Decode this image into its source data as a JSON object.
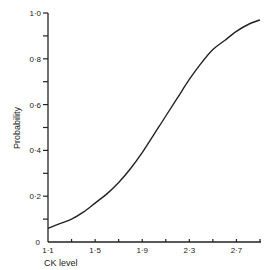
{
  "chart_data": {
    "type": "line",
    "title": "",
    "xlabel": "CK level",
    "ylabel": "Probability",
    "xlim": [
      1.1,
      2.9
    ],
    "ylim": [
      0,
      1.0
    ],
    "grid": false,
    "legend": null,
    "x_ticks": [
      1.1,
      1.3,
      1.5,
      1.7,
      1.9,
      2.1,
      2.3,
      2.5,
      2.7,
      2.9
    ],
    "x_tick_labels": [
      "1·1",
      "",
      "1·5",
      "",
      "1·9",
      "",
      "2·3",
      "",
      "2·7",
      ""
    ],
    "y_ticks": [
      0,
      0.1,
      0.2,
      0.3,
      0.4,
      0.5,
      0.6,
      0.7,
      0.8,
      0.9,
      1.0
    ],
    "y_tick_labels": [
      "0",
      "",
      "0·2",
      "",
      "0·4",
      "",
      "0·6",
      "",
      "0·8",
      "",
      "1·0"
    ],
    "series": [
      {
        "name": "Probability",
        "x": [
          1.1,
          1.2,
          1.3,
          1.4,
          1.5,
          1.6,
          1.7,
          1.8,
          1.9,
          2.0,
          2.1,
          2.2,
          2.3,
          2.4,
          2.5,
          2.6,
          2.7,
          2.8,
          2.9
        ],
        "y": [
          0.06,
          0.08,
          0.1,
          0.13,
          0.17,
          0.21,
          0.26,
          0.32,
          0.39,
          0.47,
          0.55,
          0.63,
          0.71,
          0.78,
          0.84,
          0.88,
          0.92,
          0.95,
          0.97
        ]
      }
    ],
    "color": "#222222"
  }
}
